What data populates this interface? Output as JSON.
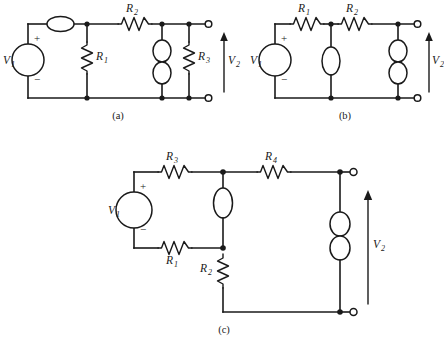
{
  "figure": {
    "type": "electrical-circuit-diagram",
    "background_color": "#ffffff",
    "line_color": "#1a1a1a",
    "subfigure_count": 3
  },
  "subfigures": [
    {
      "id": "a",
      "caption": "(a)",
      "source": {
        "label": "V",
        "subscript": "1",
        "plus": "+",
        "minus": "−",
        "symbol": "voltage-source-circle"
      },
      "output": {
        "label": "V",
        "subscript": "2",
        "arrow": "up"
      },
      "components": [
        {
          "name": "inductor-horizontal-top",
          "symbol": "ellipse",
          "orientation": "horizontal",
          "label": "",
          "subscript": ""
        },
        {
          "name": "resistor-r1",
          "symbol": "resistor",
          "orientation": "vertical",
          "label": "R",
          "subscript": "1"
        },
        {
          "name": "resistor-r2",
          "symbol": "resistor",
          "orientation": "horizontal",
          "label": "R",
          "subscript": "2"
        },
        {
          "name": "inductor-double-vertical",
          "symbol": "double-ellipse",
          "orientation": "vertical",
          "label": "",
          "subscript": ""
        },
        {
          "name": "resistor-r3",
          "symbol": "resistor",
          "orientation": "vertical",
          "label": "R",
          "subscript": "3"
        }
      ]
    },
    {
      "id": "b",
      "caption": "(b)",
      "source": {
        "label": "V",
        "subscript": "1",
        "plus": "+",
        "minus": "−",
        "symbol": "voltage-source-circle"
      },
      "output": {
        "label": "V",
        "subscript": "2",
        "arrow": "up"
      },
      "components": [
        {
          "name": "resistor-r1",
          "symbol": "resistor",
          "orientation": "horizontal",
          "label": "R",
          "subscript": "1"
        },
        {
          "name": "resistor-r2",
          "symbol": "resistor",
          "orientation": "horizontal",
          "label": "R",
          "subscript": "2"
        },
        {
          "name": "inductor-single-vertical",
          "symbol": "ellipse",
          "orientation": "vertical",
          "label": "",
          "subscript": ""
        },
        {
          "name": "inductor-double-vertical",
          "symbol": "double-ellipse",
          "orientation": "vertical",
          "label": "",
          "subscript": ""
        }
      ]
    },
    {
      "id": "c",
      "caption": "(c)",
      "source": {
        "label": "V",
        "subscript": "1",
        "plus": "+",
        "minus": "−",
        "symbol": "voltage-source-circle"
      },
      "output": {
        "label": "V",
        "subscript": "2",
        "arrow": "up"
      },
      "components": [
        {
          "name": "resistor-r3",
          "symbol": "resistor",
          "orientation": "horizontal",
          "label": "R",
          "subscript": "3"
        },
        {
          "name": "resistor-r4",
          "symbol": "resistor",
          "orientation": "horizontal",
          "label": "R",
          "subscript": "4"
        },
        {
          "name": "resistor-r1",
          "symbol": "resistor",
          "orientation": "horizontal",
          "label": "R",
          "subscript": "1"
        },
        {
          "name": "resistor-r2",
          "symbol": "resistor",
          "orientation": "vertical",
          "label": "R",
          "subscript": "2"
        },
        {
          "name": "inductor-single-vertical",
          "symbol": "ellipse",
          "orientation": "vertical",
          "label": "",
          "subscript": ""
        },
        {
          "name": "inductor-double-vertical",
          "symbol": "double-ellipse",
          "orientation": "vertical",
          "label": "",
          "subscript": ""
        }
      ]
    }
  ]
}
